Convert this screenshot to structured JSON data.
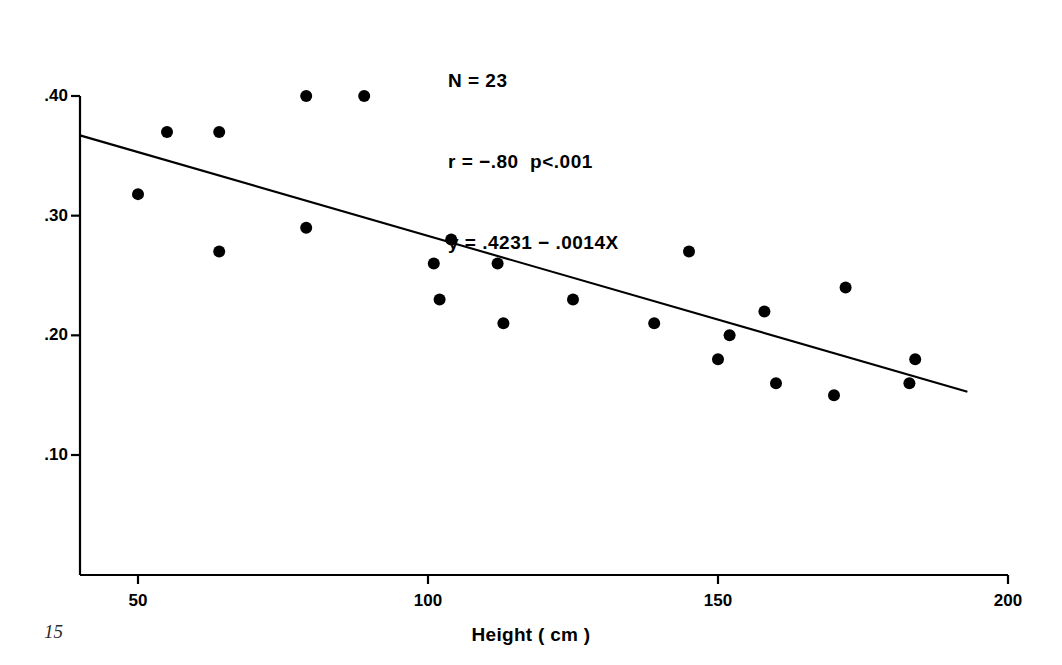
{
  "figure": {
    "page_number": "15",
    "background_color": "#ffffff",
    "ink_color": "#000000"
  },
  "chart_data": {
    "type": "scatter",
    "title": "",
    "xlabel": "Height ( cm )",
    "ylabel": "",
    "xlim": [
      40,
      200
    ],
    "ylim": [
      0.0,
      0.4
    ],
    "grid": false,
    "legend": null,
    "xticks": [
      50,
      100,
      150,
      200
    ],
    "xtick_labels": [
      "50",
      "100",
      "150",
      "200"
    ],
    "yticks": [
      0.1,
      0.2,
      0.3,
      0.4
    ],
    "ytick_labels": [
      ".10",
      ".20",
      ".30",
      ".40"
    ],
    "n": 23,
    "r": -0.8,
    "p_text": "p<.001",
    "regression": {
      "intercept": 0.4231,
      "slope": -0.0014,
      "equation": "y = .4231 − .0014X",
      "x_start": 40,
      "x_end": 193
    },
    "annotations": [
      "N = 23",
      "r = −.80  p<.001",
      "y = .4231 − .0014X"
    ],
    "marker": {
      "shape": "circle",
      "color": "#000000",
      "radius_px": 6
    },
    "points": [
      {
        "x": 50,
        "y": 0.318
      },
      {
        "x": 55,
        "y": 0.37
      },
      {
        "x": 64,
        "y": 0.37
      },
      {
        "x": 79,
        "y": 0.4
      },
      {
        "x": 89,
        "y": 0.4
      },
      {
        "x": 79,
        "y": 0.29
      },
      {
        "x": 64,
        "y": 0.27
      },
      {
        "x": 101,
        "y": 0.26
      },
      {
        "x": 104,
        "y": 0.28
      },
      {
        "x": 102,
        "y": 0.23
      },
      {
        "x": 112,
        "y": 0.26
      },
      {
        "x": 113,
        "y": 0.21
      },
      {
        "x": 125,
        "y": 0.23
      },
      {
        "x": 139,
        "y": 0.21
      },
      {
        "x": 145,
        "y": 0.27
      },
      {
        "x": 150,
        "y": 0.18
      },
      {
        "x": 152,
        "y": 0.2
      },
      {
        "x": 158,
        "y": 0.22
      },
      {
        "x": 160,
        "y": 0.16
      },
      {
        "x": 170,
        "y": 0.15
      },
      {
        "x": 172,
        "y": 0.24
      },
      {
        "x": 184,
        "y": 0.18
      },
      {
        "x": 183,
        "y": 0.16
      }
    ]
  }
}
